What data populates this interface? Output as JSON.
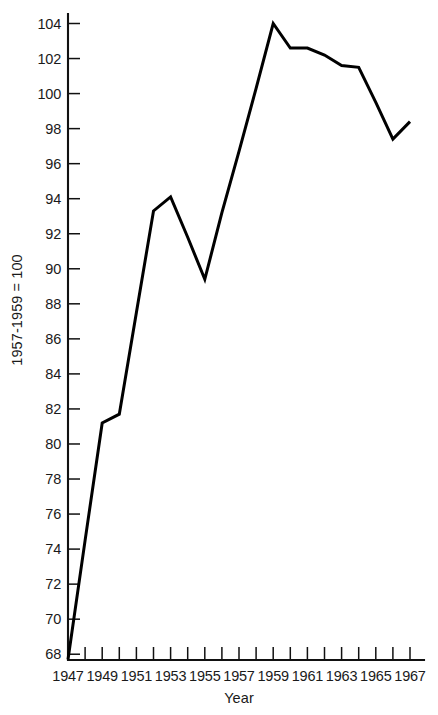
{
  "chart_data": {
    "type": "line",
    "title": "",
    "xlabel": "Year",
    "ylabel": "1957-1959 = 100",
    "xlim": [
      1947,
      1967
    ],
    "ylim": [
      67,
      105
    ],
    "ytick_start": 68,
    "ytick_end": 104,
    "ytick_step": 2,
    "xtick_step": 1,
    "xlabel_step": 2,
    "grid": false,
    "legend": "none",
    "line_color": "#000000",
    "x": [
      1947,
      1948,
      1949,
      1950,
      1951,
      1952,
      1953,
      1954,
      1955,
      1956,
      1957,
      1958,
      1959,
      1960,
      1961,
      1962,
      1963,
      1964,
      1965,
      1966,
      1967
    ],
    "values": [
      67.7,
      74.5,
      81.2,
      81.7,
      87.5,
      93.3,
      94.1,
      91.8,
      89.4,
      93.2,
      96.7,
      100.3,
      104.0,
      102.6,
      102.6,
      102.2,
      101.6,
      101.5,
      99.5,
      97.4,
      98.4
    ],
    "categories": [
      "1947",
      "1948",
      "1949",
      "1950",
      "1951",
      "1952",
      "1953",
      "1954",
      "1955",
      "1956",
      "1957",
      "1958",
      "1959",
      "1960",
      "1961",
      "1962",
      "1963",
      "1964",
      "1965",
      "1966",
      "1967"
    ],
    "ytick_labels": [
      "68",
      "70",
      "72",
      "74",
      "76",
      "78",
      "80",
      "82",
      "84",
      "86",
      "88",
      "90",
      "92",
      "94",
      "96",
      "98",
      "100",
      "102",
      "104"
    ],
    "xtick_labels_shown": [
      "1947",
      "1949",
      "1951",
      "1953",
      "1955",
      "1957",
      "1959",
      "1961",
      "1963",
      "1965",
      "1967"
    ]
  },
  "axes": {
    "y_axis_title": "1957-1959 = 100",
    "x_axis_title": "Year"
  }
}
